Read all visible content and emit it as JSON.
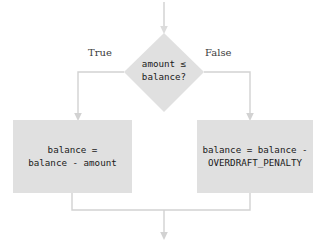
{
  "diagram": {
    "type": "flowchart",
    "colors": {
      "node_fill": "#e0e0e0",
      "connector": "#d2d2d2",
      "node_text": "#1a1a1a",
      "label_text": "#3c3c3c",
      "background": "#ffffff"
    },
    "entry_arrow": {
      "name": "entry-arrow",
      "from_y": 2,
      "to_y": 33,
      "x": 164
    },
    "decision": {
      "name": "decision-node",
      "shape": "diamond",
      "text_line1": "amount ≤",
      "text_line2": "balance?",
      "center_x": 164,
      "center_y": 72,
      "width": 80,
      "height": 79
    },
    "branches": [
      {
        "name": "true-branch",
        "label": "True",
        "direction": "left",
        "label_x": 88,
        "label_y": 47,
        "drop_x": 78
      },
      {
        "name": "false-branch",
        "label": "False",
        "direction": "right",
        "label_x": 205,
        "label_y": 47,
        "drop_x": 250
      }
    ],
    "process_boxes": [
      {
        "name": "process-box-withdraw",
        "branch": "True",
        "text_line1": "balance =",
        "text_line2": "balance - amount",
        "x": 13,
        "y": 120,
        "width": 119,
        "height": 73
      },
      {
        "name": "process-box-overdraft",
        "branch": "False",
        "text_line1": "balance = balance -",
        "text_line2": "OVERDRAFT_PENALTY",
        "x": 197,
        "y": 120,
        "width": 116,
        "height": 73
      }
    ],
    "merge": {
      "name": "merge-connector",
      "join_y": 210,
      "exit_x": 164,
      "exit_to_y": 240
    }
  }
}
